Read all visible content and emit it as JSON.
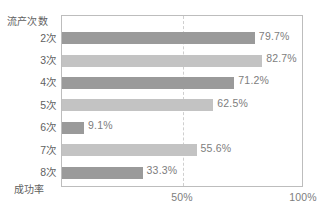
{
  "chart_data": {
    "type": "bar",
    "orientation": "horizontal",
    "title": "",
    "xlabel": "成功率",
    "ylabel": "流产次数",
    "categories": [
      "2次",
      "3次",
      "4次",
      "5次",
      "6次",
      "7次",
      "8次"
    ],
    "values": [
      79.7,
      82.7,
      71.2,
      62.5,
      9.1,
      55.6,
      33.3
    ],
    "value_labels": [
      "79.7%",
      "82.7%",
      "71.2%",
      "62.5%",
      "9.1%",
      "55.6%",
      "33.3%"
    ],
    "bar_colors": [
      "#9a9a9a",
      "#c3c3c3",
      "#9a9a9a",
      "#c3c3c3",
      "#9a9a9a",
      "#c3c3c3",
      "#9a9a9a"
    ],
    "xlim": [
      0,
      100
    ],
    "xticks": [
      50,
      100
    ],
    "xtick_labels": [
      "50%",
      "100%"
    ],
    "grid": "vertical-dashed-at-50",
    "legend": "none",
    "frame_color": "#bdbdbd",
    "gridline_color": "#cfcfcf",
    "label_color": "#7d7d7d"
  }
}
